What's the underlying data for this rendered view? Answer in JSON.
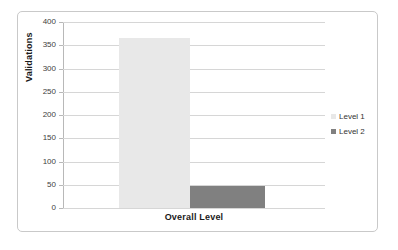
{
  "chart_data": {
    "type": "bar",
    "title": "",
    "subtitle": "",
    "xlabel": "Overall Level",
    "ylabel": "Validations",
    "categories": [
      "Overall Level"
    ],
    "series": [
      {
        "name": "Level 1",
        "values": [
          365
        ],
        "color": "#e8e8e8"
      },
      {
        "name": "Level 2",
        "values": [
          47
        ],
        "color": "#808080"
      }
    ],
    "ylim": [
      0,
      400
    ],
    "ytick_step": 50,
    "yticks": [
      400,
      350,
      300,
      250,
      200,
      150,
      100,
      50,
      0
    ],
    "ytick_labels": [
      "400",
      "350",
      "300",
      "250",
      "200",
      "150",
      "100",
      "50",
      "0"
    ],
    "grid": true,
    "grid_axis": "y",
    "legend": true,
    "legend_position": "right",
    "legend_entries": [
      "Level 1",
      "Level 2"
    ]
  },
  "figure": {
    "background_color": "#ffffff",
    "frame_color": "#c9c9c9",
    "gridline_color": "#d6d6d6",
    "axis_color": "#b8b8b8"
  }
}
